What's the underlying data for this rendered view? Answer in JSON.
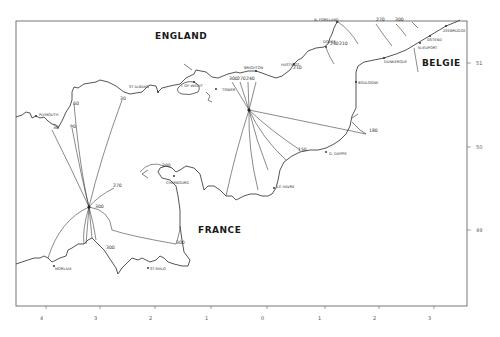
{
  "map": {
    "title": "",
    "countries": [
      {
        "name": "ENGLAND",
        "x": 155,
        "y": 32
      },
      {
        "name": "BELGIE",
        "x": 422,
        "y": 59
      },
      {
        "name": "FRANCE",
        "x": 198,
        "y": 226
      }
    ],
    "places": [
      {
        "name": "N. FORELAND",
        "x": 314,
        "y": 19
      },
      {
        "name": "DOVER",
        "x": 323,
        "y": 41
      },
      {
        "name": "ZEEBRUGGE",
        "x": 443,
        "y": 30
      },
      {
        "name": "OSTEND",
        "x": 427,
        "y": 39
      },
      {
        "name": "N.IEUPORT",
        "x": 418,
        "y": 47
      },
      {
        "name": "DUNKERQUE",
        "x": 384,
        "y": 61
      },
      {
        "name": "BOULOGNE",
        "x": 358,
        "y": 82
      },
      {
        "name": "HASTINGS",
        "x": 281,
        "y": 64
      },
      {
        "name": "BRIGHTON",
        "x": 244,
        "y": 67
      },
      {
        "name": "ST ALBANS",
        "x": 129,
        "y": 86
      },
      {
        "name": "I. OF WIGHT",
        "x": 181,
        "y": 85
      },
      {
        "name": "TOWER",
        "x": 222,
        "y": 89
      },
      {
        "name": "PLYMOUTH",
        "x": 39,
        "y": 114
      },
      {
        "name": "D. DIEPPE",
        "x": 329,
        "y": 153
      },
      {
        "name": "LE HAVRE",
        "x": 277,
        "y": 186
      },
      {
        "name": "CHERBOURG",
        "x": 166,
        "y": 182
      },
      {
        "name": "MORLAIX",
        "x": 55,
        "y": 268
      },
      {
        "name": "ST MALO",
        "x": 150,
        "y": 268
      }
    ],
    "contour_values": [
      {
        "value": "270",
        "x": 376,
        "y": 21
      },
      {
        "value": "300",
        "x": 395,
        "y": 21
      },
      {
        "value": "240",
        "x": 330,
        "y": 45
      },
      {
        "value": "210",
        "x": 339,
        "y": 45
      },
      {
        "value": "210",
        "x": 293,
        "y": 68
      },
      {
        "value": "300",
        "x": 229,
        "y": 79
      },
      {
        "value": "270",
        "x": 237,
        "y": 79
      },
      {
        "value": "240",
        "x": 246,
        "y": 79
      },
      {
        "value": "180",
        "x": 369,
        "y": 131
      },
      {
        "value": "150",
        "x": 298,
        "y": 151
      },
      {
        "value": "60",
        "x": 73,
        "y": 104
      },
      {
        "value": "30",
        "x": 122,
        "y": 99
      },
      {
        "value": "90",
        "x": 70,
        "y": 127
      },
      {
        "value": "30",
        "x": 53,
        "y": 128
      },
      {
        "value": "300",
        "x": 162,
        "y": 166
      },
      {
        "value": "270",
        "x": 115,
        "y": 186
      },
      {
        "value": "300",
        "x": 96,
        "y": 207
      },
      {
        "value": "300",
        "x": 106,
        "y": 248
      },
      {
        "value": "300",
        "x": 176,
        "y": 243
      }
    ],
    "amphidromes": [
      {
        "x": 249,
        "y": 110,
        "label": "0"
      },
      {
        "x": 89,
        "y": 207,
        "label": "0"
      }
    ],
    "x_axis": {
      "ticks": [
        {
          "label": "4",
          "x": 42
        },
        {
          "label": "3",
          "x": 96
        },
        {
          "label": "2",
          "x": 151
        },
        {
          "label": "1",
          "x": 206
        },
        {
          "label": "0",
          "x": 263
        },
        {
          "label": "1",
          "x": 318
        },
        {
          "label": "2",
          "x": 373
        },
        {
          "label": "3",
          "x": 428
        }
      ]
    },
    "y_axis": {
      "ticks": [
        {
          "label": "51",
          "y": 63
        },
        {
          "label": "50",
          "y": 147
        },
        {
          "label": "49",
          "y": 230
        }
      ]
    },
    "frame": {
      "left": 16,
      "top": 21,
      "right": 467,
      "bottom": 306
    },
    "line_color": "#2a2a2a"
  }
}
